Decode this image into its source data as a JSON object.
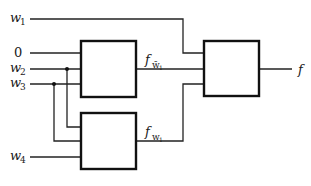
{
  "diagram": {
    "title": "",
    "inputs": [
      {
        "id": "w1",
        "label": "w",
        "subscript": "1"
      },
      {
        "id": "zero",
        "label": "0"
      },
      {
        "id": "w2",
        "label": "w",
        "subscript": "2"
      },
      {
        "id": "w3",
        "label": "w",
        "subscript": "3"
      },
      {
        "id": "w4",
        "label": "w",
        "subscript": "4"
      }
    ],
    "signals": [
      {
        "id": "f_not_w1",
        "label": "f",
        "subscript": "w̄",
        "subsubscript": "1"
      },
      {
        "id": "f_w1",
        "label": "f",
        "subscript": "w",
        "subsubscript": "1"
      }
    ],
    "output": {
      "id": "f",
      "label": "f"
    },
    "blocks": [
      {
        "id": "block-top",
        "inputs": [
          "0",
          "w2",
          "w3"
        ],
        "output": "f_not_w1"
      },
      {
        "id": "block-bottom",
        "inputs": [
          "w2",
          "w3",
          "w4"
        ],
        "output": "f_w1"
      },
      {
        "id": "block-mux",
        "inputs": [
          "w1",
          "f_not_w1",
          "f_w1"
        ],
        "output": "f"
      }
    ],
    "colors": {
      "line": "#222222",
      "background": "#ffffff"
    }
  }
}
